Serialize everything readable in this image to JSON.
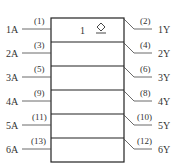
{
  "gate": {
    "function_symbol": "1",
    "output_symbol": "open-collector-diamond-icon"
  },
  "channels": [
    {
      "input": "1A",
      "input_pin": "(1)",
      "output": "1Y",
      "output_pin": "(2)"
    },
    {
      "input": "2A",
      "input_pin": "(3)",
      "output": "2Y",
      "output_pin": "(4)"
    },
    {
      "input": "3A",
      "input_pin": "(5)",
      "output": "3Y",
      "output_pin": "(6)"
    },
    {
      "input": "4A",
      "input_pin": "(9)",
      "output": "4Y",
      "output_pin": "(8)"
    },
    {
      "input": "5A",
      "input_pin": "(11)",
      "output": "5Y",
      "output_pin": "(10)"
    },
    {
      "input": "6A",
      "input_pin": "(13)",
      "output": "6Y",
      "output_pin": "(12)"
    }
  ]
}
